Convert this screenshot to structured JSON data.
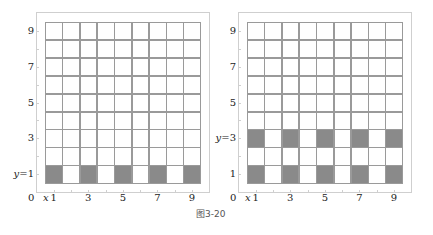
{
  "caption": "图3-20",
  "colors": {
    "filled": "#8a8a8a",
    "grid": "#9a9a9a",
    "frame": "#cfcfcf"
  },
  "panels": [
    {
      "id": "left",
      "origin_label": "0",
      "x_axis_var": "x",
      "y_labels": [
        {
          "text": "9",
          "row": 9
        },
        {
          "text": "7",
          "row": 7
        },
        {
          "text": "5",
          "row": 5
        },
        {
          "text": "3",
          "row": 3
        },
        {
          "text": "y=1",
          "row": 1
        }
      ],
      "x_labels": [
        {
          "text": "1",
          "col": 1
        },
        {
          "text": "3",
          "col": 3
        },
        {
          "text": "5",
          "col": 5
        },
        {
          "text": "7",
          "col": 7
        },
        {
          "text": "9",
          "col": 9
        }
      ],
      "filled_cells": [
        [
          1,
          1
        ],
        [
          3,
          1
        ],
        [
          5,
          1
        ],
        [
          7,
          1
        ],
        [
          9,
          1
        ]
      ]
    },
    {
      "id": "right",
      "origin_label": "0",
      "x_axis_var": "x",
      "y_labels": [
        {
          "text": "9",
          "row": 9
        },
        {
          "text": "7",
          "row": 7
        },
        {
          "text": "5",
          "row": 5
        },
        {
          "text": "y=3",
          "row": 3
        },
        {
          "text": "1",
          "row": 1
        }
      ],
      "x_labels": [
        {
          "text": "1",
          "col": 1
        },
        {
          "text": "3",
          "col": 3
        },
        {
          "text": "5",
          "col": 5
        },
        {
          "text": "7",
          "col": 7
        },
        {
          "text": "9",
          "col": 9
        }
      ],
      "filled_cells": [
        [
          1,
          1
        ],
        [
          3,
          1
        ],
        [
          5,
          1
        ],
        [
          7,
          1
        ],
        [
          9,
          1
        ],
        [
          1,
          3
        ],
        [
          3,
          3
        ],
        [
          5,
          3
        ],
        [
          7,
          3
        ],
        [
          9,
          3
        ]
      ]
    }
  ],
  "grid": {
    "cols": 9,
    "rows": 9
  }
}
